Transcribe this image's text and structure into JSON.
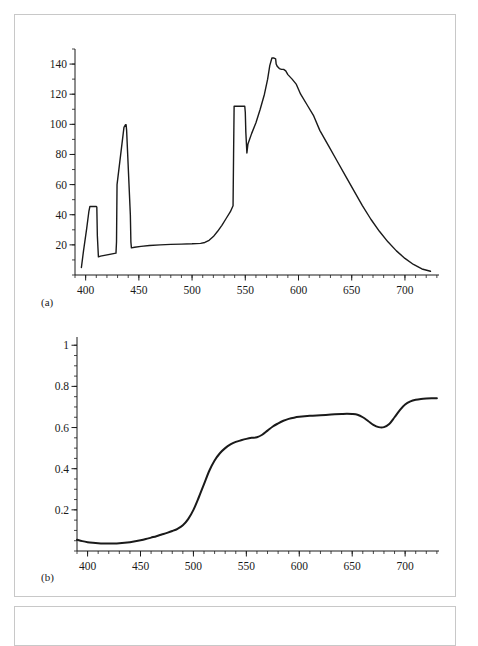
{
  "figure": {
    "panel_a_label": "(a)",
    "panel_b_label": "(b)"
  },
  "chart_data": [
    {
      "id": "panel-a",
      "type": "line",
      "title": "",
      "xlabel": "",
      "ylabel": "",
      "xlim": [
        390,
        732
      ],
      "ylim": [
        0,
        150
      ],
      "xticks": [
        400,
        450,
        500,
        550,
        600,
        650,
        700
      ],
      "xtick_labels": [
        "400",
        "450",
        "500",
        "550",
        "600",
        "650",
        "700"
      ],
      "yticks": [
        20,
        40,
        60,
        80,
        100,
        120,
        140
      ],
      "ytick_labels": [
        "20",
        "40",
        "60",
        "80",
        "100",
        "120",
        "140"
      ],
      "xminor_step": 10,
      "yminor_step": 10,
      "grid": false,
      "legend": "none",
      "series": [
        {
          "name": "spectral power distribution",
          "x": [
            396,
            398,
            401,
            403,
            404,
            404.5,
            410,
            410.5,
            411,
            412,
            414,
            428.5,
            429,
            429.5,
            436,
            437.5,
            438,
            438.5,
            442,
            442.5,
            443,
            446,
            452,
            460,
            470,
            480,
            490,
            500,
            508,
            512,
            516,
            520,
            524,
            528,
            532,
            536,
            538.5,
            539,
            539.5,
            549.5,
            550,
            550.5,
            551.5,
            552.5,
            556,
            560,
            564,
            568,
            571,
            573,
            575,
            577,
            578.5,
            579,
            580,
            582,
            584,
            586,
            588,
            590,
            594,
            598,
            602,
            608,
            614,
            620,
            628,
            636,
            644,
            652,
            660,
            668,
            676,
            684,
            692,
            700,
            708,
            716,
            724,
            730
          ],
          "y": [
            5,
            16,
            31,
            42,
            45.5,
            45.5,
            45.5,
            45,
            26,
            12,
            12.5,
            14.5,
            22,
            60,
            98,
            99.8,
            99.8,
            96,
            40,
            22,
            18,
            18.4,
            19,
            19.6,
            20,
            20.3,
            20.5,
            20.7,
            21,
            21.6,
            23,
            25.5,
            29,
            33,
            37.5,
            42,
            46,
            80,
            112,
            112,
            108,
            95,
            81,
            87,
            94,
            101,
            110,
            120,
            130,
            139,
            144,
            144,
            143.5,
            140,
            138.5,
            137,
            136.5,
            136.5,
            135.5,
            133,
            130,
            126.5,
            120,
            113,
            106,
            96,
            86,
            76,
            66,
            56,
            46,
            37,
            29,
            22,
            16,
            11,
            7,
            4,
            2.5
          ]
        }
      ]
    },
    {
      "id": "panel-b",
      "type": "line",
      "title": "",
      "xlabel": "",
      "ylabel": "",
      "xlim": [
        390,
        732
      ],
      "ylim": [
        0,
        1.04
      ],
      "xticks": [
        400,
        450,
        500,
        550,
        600,
        650,
        700
      ],
      "xtick_labels": [
        "400",
        "450",
        "500",
        "550",
        "600",
        "650",
        "700"
      ],
      "yticks": [
        0.2,
        0.4,
        0.6,
        0.8,
        1
      ],
      "ytick_labels": [
        "0.2",
        "0.4",
        "0.6",
        "0.8",
        "1"
      ],
      "xminor_step": 10,
      "yminor_step": 0.05,
      "grid": false,
      "legend": "none",
      "series": [
        {
          "name": "spectral reflectance",
          "x": [
            390,
            395,
            400,
            405,
            410,
            415,
            420,
            425,
            430,
            435,
            440,
            445,
            450,
            455,
            460,
            465,
            470,
            475,
            480,
            485,
            490,
            495,
            500,
            505,
            510,
            515,
            520,
            525,
            530,
            535,
            540,
            545,
            550,
            555,
            560,
            565,
            570,
            575,
            580,
            585,
            590,
            595,
            600,
            610,
            620,
            630,
            640,
            645,
            650,
            655,
            660,
            665,
            670,
            675,
            680,
            685,
            690,
            695,
            700,
            705,
            710,
            715,
            720,
            725,
            730
          ],
          "y": [
            0.055,
            0.048,
            0.043,
            0.04,
            0.038,
            0.037,
            0.037,
            0.037,
            0.038,
            0.04,
            0.043,
            0.047,
            0.052,
            0.058,
            0.065,
            0.072,
            0.08,
            0.088,
            0.097,
            0.108,
            0.125,
            0.155,
            0.2,
            0.26,
            0.325,
            0.39,
            0.44,
            0.475,
            0.5,
            0.518,
            0.53,
            0.538,
            0.545,
            0.55,
            0.553,
            0.565,
            0.585,
            0.605,
            0.62,
            0.633,
            0.642,
            0.648,
            0.652,
            0.657,
            0.66,
            0.663,
            0.666,
            0.667,
            0.666,
            0.662,
            0.65,
            0.632,
            0.613,
            0.602,
            0.602,
            0.617,
            0.65,
            0.685,
            0.712,
            0.727,
            0.735,
            0.739,
            0.741,
            0.742,
            0.742
          ]
        }
      ]
    }
  ]
}
